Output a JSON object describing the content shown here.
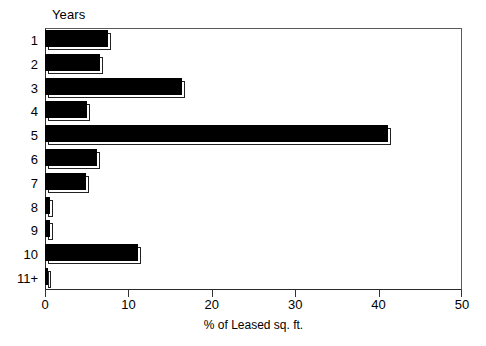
{
  "chart_data": {
    "type": "bar",
    "orientation": "horizontal",
    "title": "",
    "categories": [
      "1",
      "2",
      "3",
      "4",
      "5",
      "6",
      "7",
      "8",
      "9",
      "10",
      "11+"
    ],
    "values": [
      7.6,
      6.6,
      16.4,
      5.0,
      41.1,
      6.2,
      4.9,
      0.6,
      0.6,
      11.2,
      0.4
    ],
    "ylabel": "Years",
    "xlabel": "% of Leased sq. ft.",
    "xlim": [
      0,
      50
    ],
    "xticks": [
      0,
      10,
      20,
      30,
      40,
      50
    ],
    "xtick_labels": [
      "0",
      "10",
      "20",
      "30",
      "40",
      "50"
    ],
    "grid": false,
    "legend": false,
    "bar_color": "#000000",
    "frame_color": "#555555",
    "background": "#ffffff"
  },
  "axes": {
    "category_axis_title": "Years",
    "value_axis_title": "% of Leased sq. ft."
  }
}
